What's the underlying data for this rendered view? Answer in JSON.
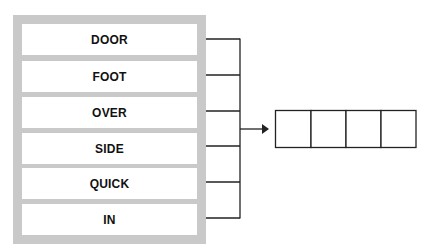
{
  "diagram": {
    "words": [
      "DOOR",
      "FOOT",
      "OVER",
      "SIDE",
      "QUICK",
      "IN"
    ],
    "answer_boxes": 4,
    "colors": {
      "panel": "#c9c9c9",
      "box_fill": "#ffffff",
      "line": "#222222",
      "text": "#111111"
    }
  }
}
